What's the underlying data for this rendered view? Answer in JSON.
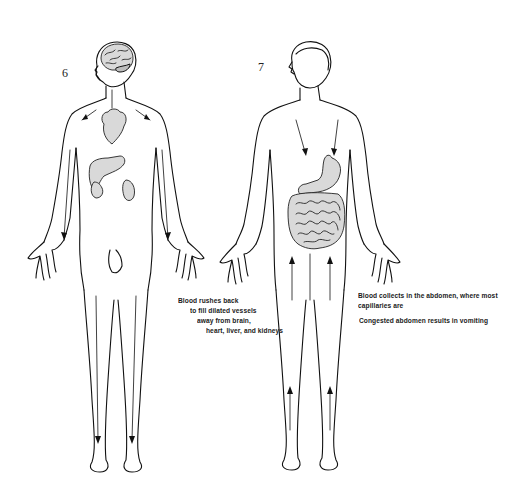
{
  "figures": [
    {
      "number": "6",
      "caption_lines": [
        "Blood rushes back",
        "to fill dilated vessels",
        "away from brain,",
        "heart, liver, and kidneys"
      ],
      "organs_shown": [
        "brain",
        "heart",
        "liver",
        "kidneys"
      ],
      "arrow_direction": "toward head and trunk (downward in limbs)"
    },
    {
      "number": "7",
      "caption_lines": [
        "Blood collects in the abdomen, where most",
        "capillaries are"
      ],
      "caption_secondary": "Congested abdomen results in vomiting",
      "organs_shown": [
        "stomach",
        "intestines"
      ],
      "arrow_direction": "toward abdomen"
    }
  ],
  "colors": {
    "background": "#ffffff",
    "ink": "#111111",
    "organ_fill": "#d9d9d9"
  }
}
